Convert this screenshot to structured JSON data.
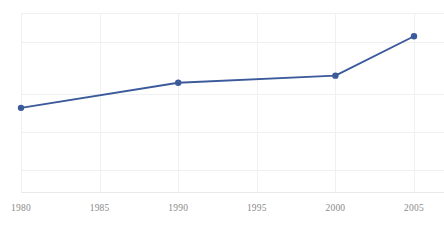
{
  "chart_data": {
    "type": "line",
    "title": "",
    "subtitle": "",
    "xlabel": "",
    "ylabel": "",
    "legend": [],
    "legend_position": "none",
    "grid": true,
    "grid_axes": "both",
    "xlim": [
      1980,
      2005
    ],
    "ylim": [
      0,
      1
    ],
    "x_tick_labels": [
      "1980",
      "1985",
      "1990",
      "1995",
      "2000",
      "2005"
    ],
    "x_ticks": [
      1980,
      1985,
      1990,
      1995,
      2000,
      2005
    ],
    "y_tick_labels": [],
    "y_ticks": [],
    "series": [
      {
        "name": "series-1",
        "color": "#3b5a9a",
        "marker": "circle",
        "x": [
          1980,
          1990,
          2000,
          2005
        ],
        "values": [
          0.47,
          0.61,
          0.65,
          0.87
        ]
      }
    ]
  },
  "axis": {
    "x_tick_label_color": "#8a8a8a",
    "grid_color": "#f0f0f2",
    "axis_color": "#e9e9ec"
  },
  "colors": {
    "series_primary": "#3b5a9a",
    "background": "#ffffff"
  }
}
